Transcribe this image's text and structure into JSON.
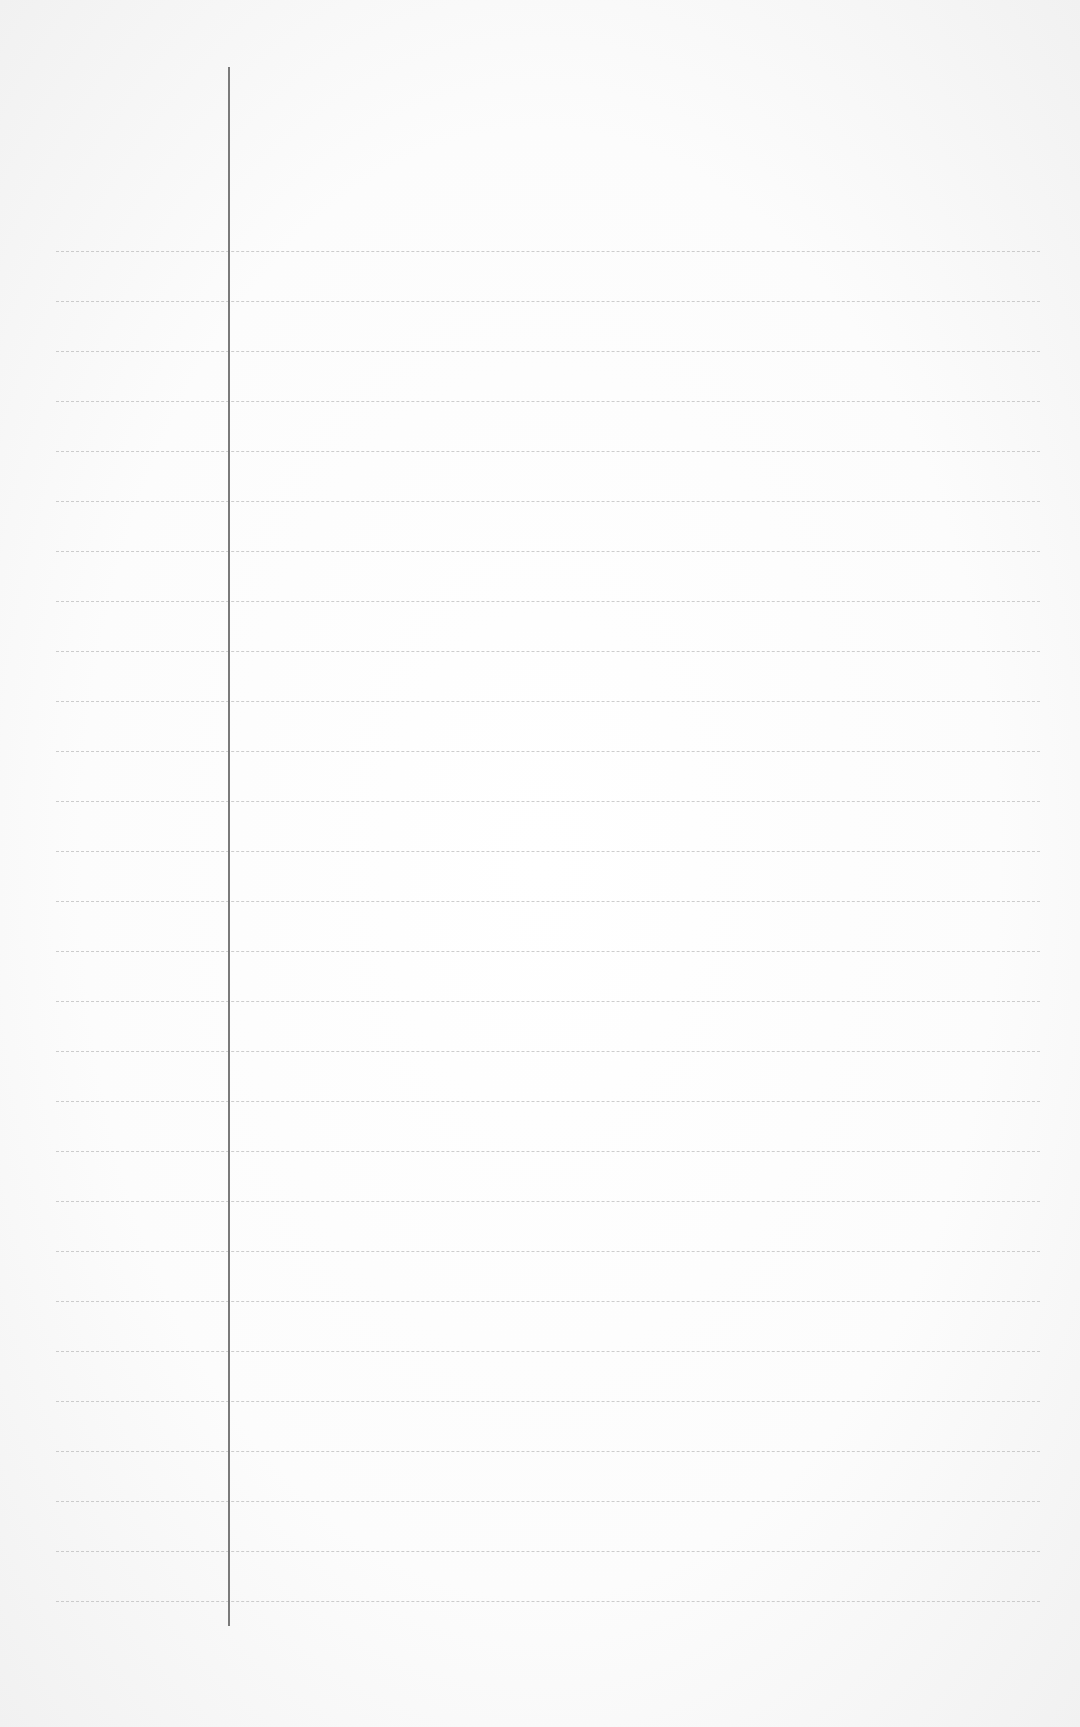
{
  "page": {
    "type": "lined-paper",
    "background_color": "#fbfbfb",
    "rule_color": "#bdbdbd",
    "margin_line_color": "#7a7a7a",
    "rules": {
      "count": 28,
      "first_y": 251,
      "last_y": 1601,
      "left_x": 56,
      "right_x": 1040
    },
    "margin_line": {
      "x": 228,
      "top_y": 67,
      "bottom_y": 1626
    }
  }
}
